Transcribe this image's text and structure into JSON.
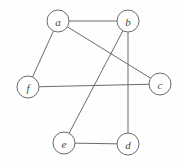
{
  "figure": {
    "width": 182,
    "height": 166,
    "background_color": "#fefefe",
    "stroke_color": "#6b6b6b",
    "node_fill_color": "#ffffff",
    "label_color": "#4a4a4a",
    "node_radius": 11
  },
  "chart_data": {
    "type": "diagram",
    "title": "",
    "graph_kind": "undirected",
    "node_count": 6,
    "edge_count": 7,
    "nodes": [
      {
        "id": "a",
        "label": "a",
        "x": 58,
        "y": 21
      },
      {
        "id": "b",
        "label": "b",
        "x": 128,
        "y": 21
      },
      {
        "id": "c",
        "label": "c",
        "x": 160,
        "y": 84
      },
      {
        "id": "d",
        "label": "d",
        "x": 128,
        "y": 144
      },
      {
        "id": "e",
        "label": "e",
        "x": 64,
        "y": 143
      },
      {
        "id": "f",
        "label": "f",
        "x": 28,
        "y": 87
      }
    ],
    "edges": [
      {
        "source": "a",
        "target": "b"
      },
      {
        "source": "a",
        "target": "f"
      },
      {
        "source": "a",
        "target": "c"
      },
      {
        "source": "b",
        "target": "d"
      },
      {
        "source": "b",
        "target": "e"
      },
      {
        "source": "f",
        "target": "c"
      },
      {
        "source": "e",
        "target": "d"
      }
    ],
    "degrees": {
      "a": 3,
      "b": 3,
      "c": 2,
      "d": 2,
      "e": 2,
      "f": 2
    }
  }
}
